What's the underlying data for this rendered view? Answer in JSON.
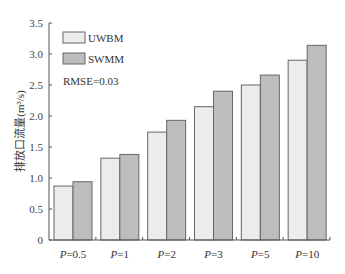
{
  "chart_data": {
    "type": "bar",
    "title": "",
    "xlabel": "",
    "ylabel": "排放口流量(m³/s)",
    "ylim": [
      0,
      3.5
    ],
    "yticks": [
      "0",
      "0.5",
      "1.0",
      "1.5",
      "2.0",
      "2.5",
      "3.0",
      "3.5"
    ],
    "categories": [
      "P=0.5",
      "P=1",
      "P=2",
      "P=3",
      "P=5",
      "P=10"
    ],
    "series": [
      {
        "name": "UWBM",
        "color": "#ececec",
        "values": [
          0.87,
          1.32,
          1.74,
          2.15,
          2.5,
          2.9
        ]
      },
      {
        "name": "SWMM",
        "color": "#bdbdbd",
        "values": [
          0.94,
          1.38,
          1.93,
          2.4,
          2.66,
          3.14
        ]
      }
    ],
    "annotations": [
      "RMSE=0.03"
    ],
    "grid": false,
    "legend_position": "upper left"
  },
  "legend": {
    "items": [
      "UWBM",
      "SWMM"
    ]
  },
  "annotation": {
    "text": "RMSE=0.03"
  },
  "axis": {
    "ylabel": "排放口流量(m³/s)"
  }
}
